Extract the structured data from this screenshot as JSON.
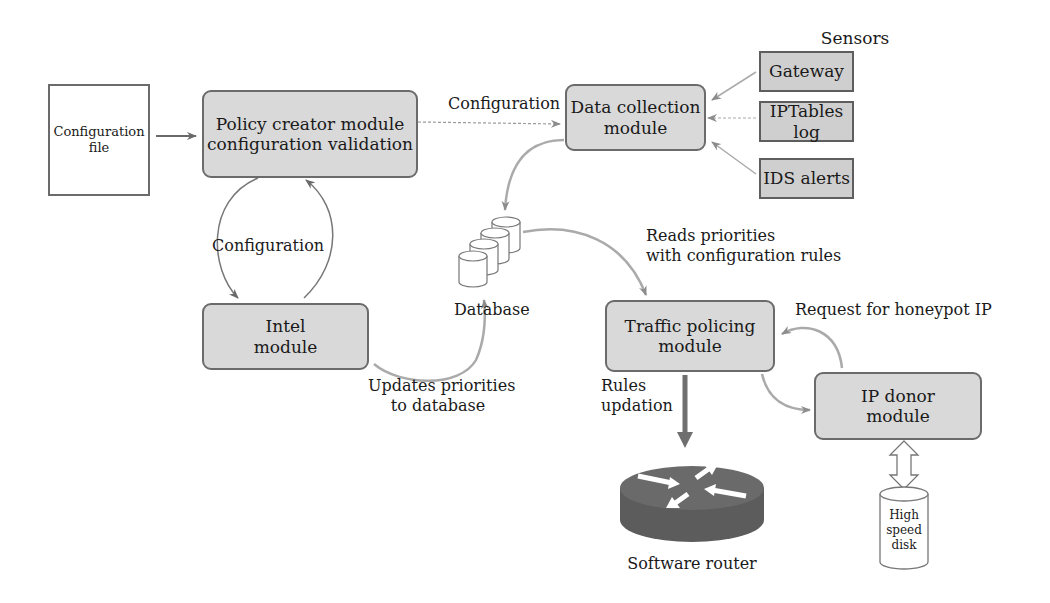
{
  "nodes": {
    "config_file": {
      "lines": [
        "Configuration",
        "file"
      ]
    },
    "policy_creator": {
      "lines": [
        "Policy creator module",
        "configuration validation"
      ]
    },
    "data_collection": {
      "lines": [
        "Data collection",
        "module"
      ]
    },
    "intel": {
      "lines": [
        "Intel",
        "module"
      ]
    },
    "traffic_policing": {
      "lines": [
        "Traffic policing",
        "module"
      ]
    },
    "ip_donor": {
      "lines": [
        "IP donor",
        "module"
      ]
    },
    "database": {
      "label": "Database"
    },
    "software_router": {
      "label": "Software router"
    },
    "high_speed_disk": {
      "lines": [
        "High",
        "speed",
        "disk"
      ]
    }
  },
  "sensors": {
    "title": "Sensors",
    "items": [
      "Gateway",
      "IPTables log",
      "IDS alerts"
    ]
  },
  "edge_labels": {
    "config_to_data": "Configuration",
    "policy_intel_loop": "Configuration",
    "reads_priorities": [
      "Reads priorities",
      "with configuration rules"
    ],
    "updates_priorities": [
      "Updates priorities",
      "to database"
    ],
    "request_honeypot": "Request for honeypot IP",
    "rules_updation": [
      "Rules",
      "updation"
    ]
  },
  "colors": {
    "module_fill": "#d9d9d9",
    "module_border": "#6b6b6b",
    "arrow": "#8c8c8c",
    "router": "#5f5f5f"
  }
}
